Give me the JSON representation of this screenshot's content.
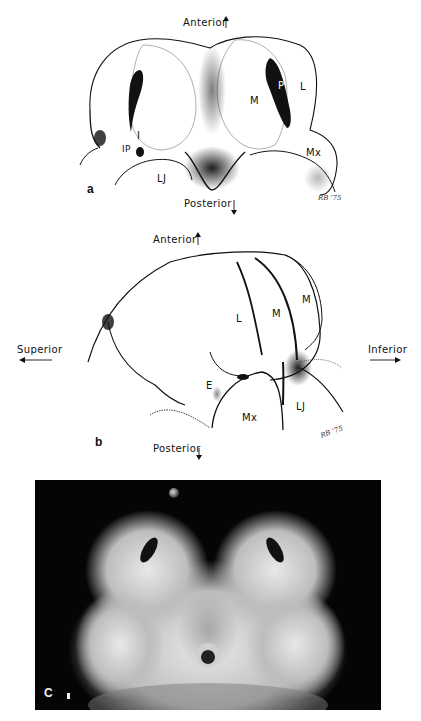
{
  "figure": {
    "panels": [
      {
        "id": "a",
        "letter": "a",
        "orientation": {
          "top": "Anterior",
          "bottom": "Posterior"
        },
        "labels": {
          "P": "P",
          "L": "L",
          "M": "M",
          "I": "I",
          "IP": "IP",
          "Mx": "Mx",
          "LJ": "LJ"
        },
        "signature": "RB '75"
      },
      {
        "id": "b",
        "letter": "b",
        "orientation": {
          "top": "Anterior",
          "bottom": "Posterior",
          "left": "Superior",
          "right": "Inferior"
        },
        "labels": {
          "L": "L",
          "M1": "M",
          "M2": "M",
          "E": "E",
          "Mx": "Mx",
          "LJ": "LJ"
        },
        "signature": "RB '75"
      },
      {
        "id": "c",
        "letter": "C",
        "type": "photograph"
      }
    ],
    "colors": {
      "ink": "#111111",
      "photo_bg": "#050505",
      "paper": "#ffffff"
    }
  }
}
